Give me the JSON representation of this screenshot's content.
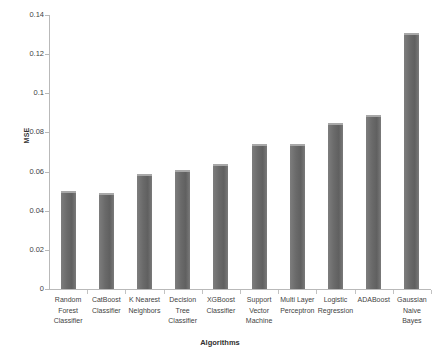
{
  "chart_data": {
    "type": "bar",
    "title": "",
    "xlabel": "Algorithms",
    "ylabel": "MSE",
    "categories": [
      "Random Forest Classifier",
      "CatBoost Classifier",
      "K Nearest Neighbors",
      "Decision Tree Classifier",
      "XGBoost Classifier",
      "Support Vector Machine",
      "Multi Layer Perceptron",
      "Logistic Regression",
      "ADABoost",
      "Gaussian Naive Bayes"
    ],
    "category_lines": [
      [
        "Random",
        "Forest",
        "Classifier"
      ],
      [
        "CatBoost",
        "Classifier"
      ],
      [
        "K Nearest",
        "Neighbors"
      ],
      [
        "Decision",
        "Tree",
        "Classifier"
      ],
      [
        "XGBoost",
        "Classifier"
      ],
      [
        "Support",
        "Vector",
        "Machine"
      ],
      [
        "Multi Layer",
        "Perceptron"
      ],
      [
        "Logistic",
        "Regression"
      ],
      [
        "ADABoost"
      ],
      [
        "Gaussian",
        "Naive",
        "Bayes"
      ]
    ],
    "values": [
      0.05,
      0.049,
      0.059,
      0.061,
      0.064,
      0.074,
      0.074,
      0.085,
      0.089,
      0.131
    ],
    "ylim": [
      0,
      0.14
    ],
    "yticks": [
      0,
      0.02,
      0.04,
      0.06,
      0.08,
      0.1,
      0.12,
      0.14
    ],
    "ytick_labels": [
      "0",
      "0.02",
      "0.04",
      "0.06",
      "0.08",
      "0.1",
      "0.12",
      "0.14"
    ],
    "grid": false,
    "legend": false,
    "bar_color": "#6a6a6a",
    "axis_color": "#b9b9b9",
    "background": "#ffffff"
  }
}
